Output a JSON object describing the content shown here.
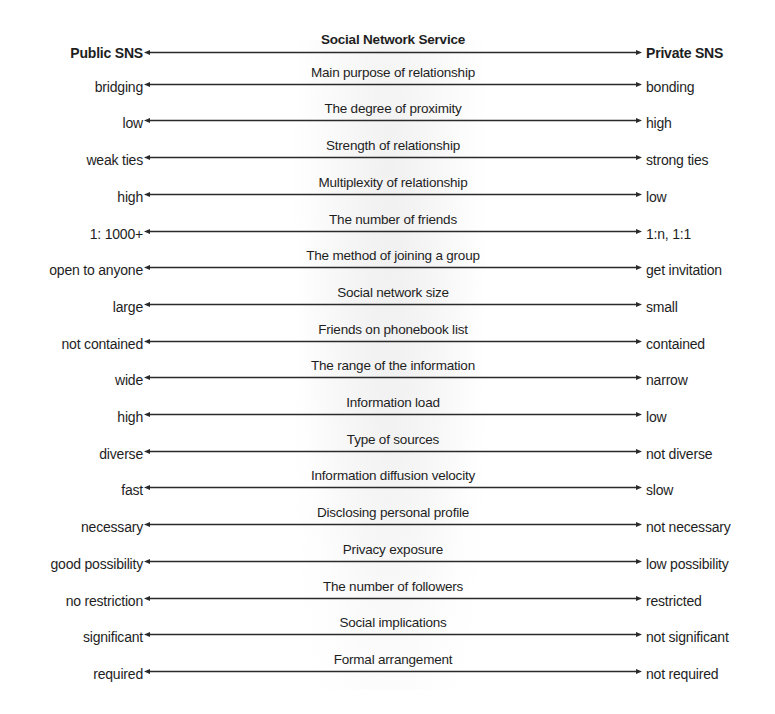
{
  "diagram": {
    "header": {
      "left": "Public SNS",
      "center": "Social Network Service",
      "right": "Private SNS"
    },
    "rows": [
      {
        "center": "Main purpose of relationship",
        "left": "bridging",
        "right": "bonding"
      },
      {
        "center": "The degree of proximity",
        "left": "low",
        "right": "high"
      },
      {
        "center": "Strength of relationship",
        "left": "weak ties",
        "right": "strong ties"
      },
      {
        "center": "Multiplexity of relationship",
        "left": "high",
        "right": "low"
      },
      {
        "center": "The number of friends",
        "left": "1: 1000+",
        "right": "1:n, 1:1"
      },
      {
        "center": "The method of joining a group",
        "left": "open to anyone",
        "right": "get invitation"
      },
      {
        "center": "Social network size",
        "left": "large",
        "right": "small"
      },
      {
        "center": "Friends on phonebook list",
        "left": "not contained",
        "right": "contained"
      },
      {
        "center": "The range of the information",
        "left": "wide",
        "right": "narrow"
      },
      {
        "center": "Information load",
        "left": "high",
        "right": "low"
      },
      {
        "center": "Type of sources",
        "left": "diverse",
        "right": "not diverse"
      },
      {
        "center": "Information diffusion velocity",
        "left": "fast",
        "right": "slow"
      },
      {
        "center": "Disclosing personal profile",
        "left": "necessary",
        "right": "not necessary"
      },
      {
        "center": "Privacy exposure",
        "left": "good possibility",
        "right": "low possibility"
      },
      {
        "center": "The number of followers",
        "left": "no restriction",
        "right": "restricted"
      },
      {
        "center": "Social implications",
        "left": "significant",
        "right": "not significant"
      },
      {
        "center": "Formal arrangement",
        "left": "required",
        "right": "not required"
      }
    ],
    "icons": {
      "arrow": "double-headed-arrow-icon"
    },
    "colors": {
      "line": "#2a2a2a",
      "text": "#1e1e1e",
      "background": "#ffffff"
    }
  }
}
